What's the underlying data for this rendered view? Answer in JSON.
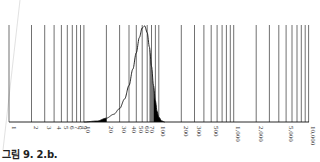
{
  "caption": "그림 9. 2.b.",
  "chart_data": {
    "type": "area",
    "title": "",
    "xlabel": "",
    "ylabel": "",
    "x_scale": "log",
    "xlim": [
      1,
      10000
    ],
    "grid": true,
    "legend": null,
    "tick_labels": [
      "1",
      "2",
      "3",
      "4",
      "5",
      "6",
      "7",
      "8",
      "9",
      "10",
      "20",
      "30",
      "40",
      "50",
      "60",
      "70",
      "100",
      "200",
      "300",
      "500",
      "1,000",
      "2,000",
      "5,000",
      "10,000"
    ],
    "gridlines": [
      1,
      2,
      3,
      4,
      5,
      6,
      7,
      8,
      9,
      10,
      20,
      30,
      40,
      50,
      60,
      70,
      80,
      90,
      100,
      200,
      300,
      400,
      500,
      600,
      700,
      800,
      900,
      1000,
      2000,
      3000,
      4000,
      5000,
      6000,
      7000,
      8000,
      9000,
      10000
    ],
    "series": [
      {
        "name": "distribution curve",
        "description": "Right-skewed bell curve on log axis, long left tail, peak near 65",
        "peak_x": 65,
        "points": [
          [
            10,
            0
          ],
          [
            15,
            0.01
          ],
          [
            20,
            0.04
          ],
          [
            25,
            0.08
          ],
          [
            30,
            0.14
          ],
          [
            35,
            0.24
          ],
          [
            40,
            0.38
          ],
          [
            45,
            0.55
          ],
          [
            50,
            0.72
          ],
          [
            55,
            0.88
          ],
          [
            60,
            0.98
          ],
          [
            65,
            1.0
          ],
          [
            70,
            0.93
          ],
          [
            75,
            0.78
          ],
          [
            80,
            0.58
          ],
          [
            85,
            0.38
          ],
          [
            90,
            0.22
          ],
          [
            95,
            0.11
          ],
          [
            100,
            0.05
          ],
          [
            110,
            0.01
          ],
          [
            120,
            0
          ]
        ]
      }
    ],
    "shaded_regions": [
      {
        "from": 10,
        "to": 20,
        "fill": "#000000",
        "label": "left tail"
      },
      {
        "from": 75,
        "to": 85,
        "fill": "#777777",
        "label": "gray band"
      },
      {
        "from": 85,
        "to": 120,
        "fill": "#000000",
        "label": "right tail"
      }
    ]
  }
}
